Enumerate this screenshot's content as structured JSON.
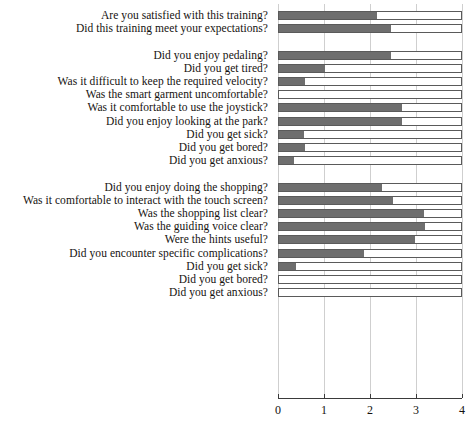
{
  "chart_data": {
    "type": "bar",
    "orientation": "horizontal",
    "title": "",
    "xlabel": "",
    "ylabel": "",
    "xlim": [
      0,
      4
    ],
    "xticks": [
      "0",
      "1",
      "2",
      "3",
      "4"
    ],
    "grid": true,
    "legend": "none",
    "bar_fill_color": "#6e6e6e",
    "bar_outline_color": "#5a5a5a",
    "bar_track_color": "#ffffff",
    "groups": [
      {
        "name": "general",
        "categories": [
          "Are you satisfied with this training?",
          "Did this training meet your expectations?"
        ],
        "values": [
          2.13,
          2.43
        ]
      },
      {
        "name": "pedaling",
        "categories": [
          "Did you enjoy pedaling?",
          "Did you get tired?",
          "Was it difficult to keep the required velocity?",
          "Was the smart garment uncomfortable?",
          "Was it comfortable to use the joystick?",
          "Did you enjoy looking at the park?",
          "Did you get sick?",
          "Did you get bored?",
          "Did you get anxious?"
        ],
        "values": [
          2.43,
          1.0,
          0.57,
          0.0,
          2.68,
          2.67,
          0.55,
          0.57,
          0.33
        ]
      },
      {
        "name": "shopping",
        "categories": [
          "Did you enjoy doing the shopping?",
          "Was it comfortable to interact with the touch screen?",
          "Was the shopping list clear?",
          "Was the guiding voice clear?",
          "Were the hints useful?",
          "Did you encounter specific complications?",
          "Did you get sick?",
          "Did you get bored?",
          "Did you get anxious?"
        ],
        "values": [
          2.24,
          2.48,
          3.15,
          3.17,
          2.96,
          1.85,
          0.37,
          0.0,
          0.0
        ]
      }
    ]
  }
}
